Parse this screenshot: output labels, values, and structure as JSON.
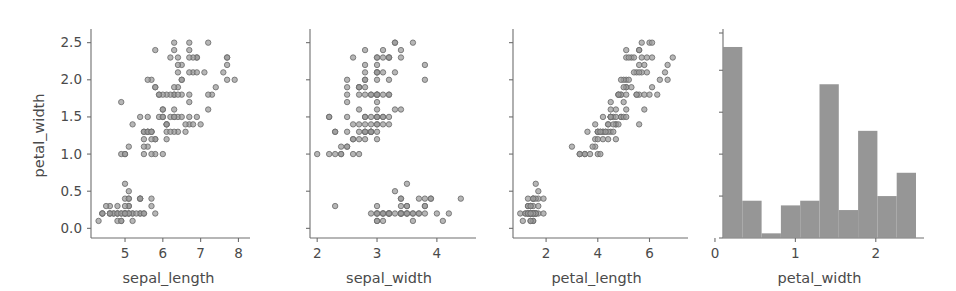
{
  "figure": {
    "type": "pairplot-row",
    "background": "#ffffff",
    "marker_color": "#9a9a9a",
    "marker_edge_color": "#6d6d6d",
    "bar_color": "#909090",
    "axis_color": "#6e6e6e",
    "text_color": "#4a4a4a",
    "shared_ylabel": "petal_width"
  },
  "chart_data": [
    {
      "type": "scatter",
      "title": "",
      "xlabel": "sepal_length",
      "ylabel": "petal_width",
      "xlim": [
        4.1,
        8.2
      ],
      "ylim": [
        -0.13,
        2.63
      ],
      "xticks": [
        5,
        6,
        7,
        8
      ],
      "xticklabels": [
        "5",
        "6",
        "7",
        "8"
      ],
      "yticks": [
        0.0,
        0.5,
        1.0,
        1.5,
        2.0,
        2.5
      ],
      "yticklabels": [
        "0.0",
        "0.5",
        "1.0",
        "1.5",
        "2.0",
        "2.5"
      ],
      "grid": false,
      "legend": "none",
      "x": [
        5.1,
        4.9,
        4.7,
        4.6,
        5.0,
        5.4,
        4.6,
        5.0,
        4.4,
        4.9,
        5.4,
        4.8,
        4.8,
        4.3,
        5.8,
        5.7,
        5.4,
        5.1,
        5.7,
        5.1,
        5.4,
        5.1,
        4.6,
        5.1,
        4.8,
        5.0,
        5.0,
        5.2,
        5.2,
        4.7,
        4.8,
        5.4,
        5.2,
        5.5,
        4.9,
        5.0,
        5.5,
        4.9,
        4.4,
        5.1,
        5.0,
        4.5,
        4.4,
        5.0,
        5.1,
        4.8,
        5.1,
        4.6,
        5.3,
        5.0,
        7.0,
        6.4,
        6.9,
        5.5,
        6.5,
        5.7,
        6.3,
        4.9,
        6.6,
        5.2,
        5.0,
        5.9,
        6.0,
        6.1,
        5.6,
        6.7,
        5.6,
        5.8,
        6.2,
        5.6,
        5.9,
        6.1,
        6.3,
        6.1,
        6.4,
        6.6,
        6.8,
        6.7,
        6.0,
        5.7,
        5.5,
        5.5,
        5.8,
        6.0,
        5.4,
        6.0,
        6.7,
        6.3,
        5.6,
        5.5,
        5.5,
        6.1,
        5.8,
        5.0,
        5.6,
        5.7,
        5.7,
        6.2,
        5.1,
        5.7,
        6.3,
        5.8,
        7.1,
        6.3,
        6.5,
        7.6,
        4.9,
        7.3,
        6.7,
        7.2,
        6.5,
        6.4,
        6.8,
        5.7,
        5.8,
        6.4,
        6.5,
        7.7,
        7.7,
        6.0,
        6.9,
        5.6,
        7.7,
        6.3,
        6.7,
        7.2,
        6.2,
        6.1,
        6.4,
        7.2,
        7.4,
        7.9,
        6.4,
        6.3,
        6.1,
        7.7,
        6.3,
        6.4,
        6.0,
        6.9,
        6.7,
        6.9,
        5.8,
        6.8,
        6.7,
        6.7,
        6.3,
        6.5,
        6.2,
        5.9
      ],
      "y": [
        0.2,
        0.2,
        0.2,
        0.2,
        0.2,
        0.4,
        0.3,
        0.2,
        0.2,
        0.1,
        0.2,
        0.2,
        0.1,
        0.1,
        0.2,
        0.4,
        0.4,
        0.3,
        0.3,
        0.3,
        0.2,
        0.4,
        0.2,
        0.5,
        0.2,
        0.2,
        0.4,
        0.2,
        0.2,
        0.2,
        0.2,
        0.4,
        0.1,
        0.2,
        0.2,
        0.2,
        0.2,
        0.1,
        0.2,
        0.2,
        0.3,
        0.3,
        0.2,
        0.6,
        0.4,
        0.3,
        0.2,
        0.2,
        0.2,
        0.2,
        1.4,
        1.5,
        1.5,
        1.3,
        1.5,
        1.3,
        1.6,
        1.0,
        1.3,
        1.4,
        1.0,
        1.5,
        1.0,
        1.4,
        1.3,
        1.4,
        1.5,
        1.0,
        1.5,
        1.1,
        1.8,
        1.3,
        1.5,
        1.2,
        1.3,
        1.4,
        1.4,
        1.7,
        1.5,
        1.0,
        1.1,
        1.0,
        1.2,
        1.6,
        1.5,
        1.6,
        1.5,
        1.3,
        1.3,
        1.3,
        1.2,
        1.4,
        1.2,
        1.0,
        1.3,
        1.2,
        1.3,
        1.3,
        1.1,
        1.3,
        2.5,
        1.9,
        2.1,
        1.8,
        2.2,
        2.1,
        1.7,
        1.8,
        1.8,
        2.5,
        2.0,
        1.9,
        2.1,
        2.0,
        2.4,
        2.3,
        1.8,
        2.2,
        2.3,
        1.5,
        2.3,
        2.0,
        2.0,
        1.8,
        2.1,
        1.8,
        1.8,
        1.8,
        2.1,
        1.6,
        1.9,
        2.0,
        2.2,
        1.5,
        1.4,
        2.3,
        2.4,
        1.8,
        1.8,
        2.1,
        2.4,
        2.3,
        1.9,
        2.3,
        2.5,
        2.3,
        1.9,
        2.0,
        2.3,
        1.8
      ]
    },
    {
      "type": "scatter",
      "title": "",
      "xlabel": "sepal_width",
      "ylabel": "petal_width",
      "xlim": [
        1.88,
        4.52
      ],
      "ylim": [
        -0.13,
        2.63
      ],
      "xticks": [
        2,
        3,
        4
      ],
      "xticklabels": [
        "2",
        "3",
        "4"
      ],
      "yticks": [
        0.0,
        0.5,
        1.0,
        1.5,
        2.0,
        2.5
      ],
      "yticklabels": [],
      "grid": false,
      "legend": "none",
      "x": [
        3.5,
        3.0,
        3.2,
        3.1,
        3.6,
        3.9,
        3.4,
        3.4,
        2.9,
        3.1,
        3.7,
        3.4,
        3.0,
        3.0,
        4.0,
        4.4,
        3.9,
        3.5,
        3.8,
        3.8,
        3.4,
        3.7,
        3.6,
        3.3,
        3.4,
        3.0,
        3.4,
        3.5,
        3.4,
        3.2,
        3.1,
        3.4,
        4.1,
        4.2,
        3.1,
        3.2,
        3.5,
        3.6,
        3.0,
        3.4,
        3.5,
        2.3,
        3.2,
        3.5,
        3.8,
        3.0,
        3.8,
        3.2,
        3.7,
        3.3,
        3.2,
        3.2,
        3.1,
        2.3,
        2.8,
        2.8,
        3.3,
        2.4,
        2.9,
        2.7,
        2.0,
        3.0,
        2.2,
        2.9,
        2.9,
        3.1,
        3.0,
        2.7,
        2.2,
        2.5,
        3.2,
        2.8,
        2.5,
        2.8,
        2.9,
        3.0,
        2.8,
        3.0,
        2.9,
        2.6,
        2.4,
        2.4,
        2.7,
        2.7,
        3.0,
        3.4,
        3.1,
        2.3,
        3.0,
        2.5,
        2.6,
        3.0,
        2.6,
        2.3,
        2.7,
        3.0,
        2.9,
        2.9,
        2.5,
        2.8,
        3.3,
        2.7,
        3.0,
        2.9,
        3.0,
        3.0,
        2.5,
        2.9,
        2.5,
        3.6,
        3.2,
        2.7,
        3.0,
        2.5,
        2.8,
        3.2,
        3.0,
        3.8,
        2.6,
        2.2,
        3.2,
        2.8,
        2.8,
        2.7,
        3.3,
        3.2,
        2.8,
        3.0,
        2.8,
        3.0,
        2.8,
        3.8,
        2.8,
        2.8,
        2.6,
        3.0,
        3.4,
        3.1,
        3.0,
        3.1,
        3.1,
        3.1,
        2.7,
        3.2,
        3.3,
        3.0,
        2.5,
        3.0,
        3.4,
        3.0
      ],
      "y": [
        0.2,
        0.2,
        0.2,
        0.2,
        0.2,
        0.4,
        0.3,
        0.2,
        0.2,
        0.1,
        0.2,
        0.2,
        0.1,
        0.1,
        0.2,
        0.4,
        0.4,
        0.3,
        0.3,
        0.3,
        0.2,
        0.4,
        0.2,
        0.5,
        0.2,
        0.2,
        0.4,
        0.2,
        0.2,
        0.2,
        0.2,
        0.4,
        0.1,
        0.2,
        0.2,
        0.2,
        0.2,
        0.1,
        0.2,
        0.2,
        0.3,
        0.3,
        0.2,
        0.6,
        0.4,
        0.3,
        0.2,
        0.2,
        0.2,
        0.2,
        1.4,
        1.5,
        1.5,
        1.3,
        1.5,
        1.3,
        1.6,
        1.0,
        1.3,
        1.4,
        1.0,
        1.5,
        1.0,
        1.4,
        1.3,
        1.4,
        1.5,
        1.0,
        1.5,
        1.1,
        1.8,
        1.3,
        1.5,
        1.2,
        1.3,
        1.4,
        1.4,
        1.7,
        1.5,
        1.0,
        1.1,
        1.0,
        1.2,
        1.6,
        1.5,
        1.6,
        1.5,
        1.3,
        1.3,
        1.3,
        1.2,
        1.4,
        1.2,
        1.0,
        1.3,
        1.2,
        1.3,
        1.3,
        1.1,
        1.3,
        2.5,
        1.9,
        2.1,
        1.8,
        2.2,
        2.1,
        1.7,
        1.8,
        1.8,
        2.5,
        2.0,
        1.9,
        2.1,
        2.0,
        2.4,
        2.3,
        1.8,
        2.2,
        2.3,
        1.5,
        2.3,
        2.0,
        2.0,
        1.8,
        2.1,
        1.8,
        1.8,
        1.8,
        2.1,
        1.6,
        1.9,
        2.0,
        2.2,
        1.5,
        1.4,
        2.3,
        2.4,
        1.8,
        1.8,
        2.1,
        2.4,
        2.3,
        1.9,
        2.3,
        2.5,
        2.3,
        1.9,
        2.0,
        2.3,
        1.8
      ]
    },
    {
      "type": "scatter",
      "title": "",
      "xlabel": "petal_length",
      "ylabel": "petal_width",
      "xlim": [
        0.72,
        7.18
      ],
      "ylim": [
        -0.13,
        2.63
      ],
      "xticks": [
        2,
        4,
        6
      ],
      "xticklabels": [
        "2",
        "4",
        "6"
      ],
      "yticks": [
        0.0,
        0.5,
        1.0,
        1.5,
        2.0,
        2.5
      ],
      "yticklabels": [],
      "grid": false,
      "legend": "none",
      "x": [
        1.4,
        1.4,
        1.3,
        1.5,
        1.4,
        1.7,
        1.4,
        1.5,
        1.4,
        1.5,
        1.5,
        1.6,
        1.4,
        1.1,
        1.2,
        1.5,
        1.3,
        1.4,
        1.7,
        1.5,
        1.7,
        1.5,
        1.0,
        1.7,
        1.9,
        1.6,
        1.6,
        1.5,
        1.4,
        1.6,
        1.6,
        1.5,
        1.5,
        1.4,
        1.5,
        1.2,
        1.3,
        1.4,
        1.3,
        1.5,
        1.3,
        1.3,
        1.3,
        1.6,
        1.9,
        1.4,
        1.6,
        1.4,
        1.5,
        1.4,
        4.7,
        4.5,
        4.9,
        4.0,
        4.6,
        4.5,
        4.7,
        3.3,
        4.6,
        3.9,
        3.5,
        4.2,
        4.0,
        4.7,
        3.6,
        4.4,
        4.5,
        4.1,
        4.5,
        3.9,
        4.8,
        4.0,
        4.9,
        4.7,
        4.3,
        4.4,
        4.8,
        5.0,
        4.5,
        3.5,
        3.8,
        3.7,
        3.9,
        5.1,
        4.5,
        4.5,
        4.7,
        4.4,
        4.1,
        4.0,
        4.4,
        4.6,
        4.0,
        3.3,
        4.2,
        4.2,
        4.2,
        4.3,
        3.0,
        4.1,
        6.0,
        5.1,
        5.9,
        5.6,
        5.8,
        6.6,
        4.5,
        6.3,
        5.8,
        6.1,
        5.1,
        5.3,
        5.5,
        5.0,
        5.1,
        5.3,
        5.5,
        6.7,
        6.9,
        5.0,
        5.7,
        4.9,
        6.7,
        4.9,
        5.7,
        6.0,
        4.8,
        4.9,
        5.6,
        5.8,
        6.1,
        6.4,
        5.6,
        5.1,
        5.6,
        6.1,
        5.6,
        5.5,
        4.8,
        5.4,
        5.6,
        5.1,
        5.1,
        5.9,
        5.7,
        5.2,
        5.0,
        5.2,
        5.4,
        5.1
      ],
      "y": [
        0.2,
        0.2,
        0.2,
        0.2,
        0.2,
        0.4,
        0.3,
        0.2,
        0.2,
        0.1,
        0.2,
        0.2,
        0.1,
        0.1,
        0.2,
        0.4,
        0.4,
        0.3,
        0.3,
        0.3,
        0.2,
        0.4,
        0.2,
        0.5,
        0.2,
        0.2,
        0.4,
        0.2,
        0.2,
        0.2,
        0.2,
        0.4,
        0.1,
        0.2,
        0.2,
        0.2,
        0.2,
        0.1,
        0.2,
        0.2,
        0.3,
        0.3,
        0.2,
        0.6,
        0.4,
        0.3,
        0.2,
        0.2,
        0.2,
        0.2,
        1.4,
        1.5,
        1.5,
        1.3,
        1.5,
        1.3,
        1.6,
        1.0,
        1.3,
        1.4,
        1.0,
        1.5,
        1.0,
        1.4,
        1.3,
        1.4,
        1.5,
        1.0,
        1.5,
        1.1,
        1.8,
        1.3,
        1.5,
        1.2,
        1.3,
        1.4,
        1.4,
        1.7,
        1.5,
        1.0,
        1.1,
        1.0,
        1.2,
        1.6,
        1.5,
        1.6,
        1.5,
        1.3,
        1.3,
        1.3,
        1.2,
        1.4,
        1.2,
        1.0,
        1.3,
        1.2,
        1.3,
        1.3,
        1.1,
        1.3,
        2.5,
        1.9,
        2.1,
        1.8,
        2.2,
        2.1,
        1.7,
        1.8,
        1.8,
        2.5,
        2.0,
        1.9,
        2.1,
        2.0,
        2.4,
        2.3,
        1.8,
        2.2,
        2.3,
        1.5,
        2.3,
        2.0,
        2.0,
        1.8,
        2.1,
        1.8,
        1.8,
        1.8,
        2.1,
        1.6,
        1.9,
        2.0,
        2.2,
        1.5,
        1.4,
        2.3,
        2.4,
        1.8,
        1.8,
        2.1,
        2.4,
        2.3,
        1.9,
        2.3,
        2.5,
        2.3,
        1.9,
        2.0,
        2.3,
        1.8
      ]
    },
    {
      "type": "bar",
      "subtype": "histogram",
      "title": "",
      "xlabel": "petal_width",
      "ylabel": "",
      "xlim": [
        0.1,
        2.5
      ],
      "ylim": [
        0,
        44
      ],
      "xticks": [
        0,
        1,
        2
      ],
      "xticklabels": [
        "0",
        "1",
        "2"
      ],
      "yticks": [
        0,
        9,
        18,
        27,
        36,
        44
      ],
      "yticklabels": [],
      "grid": false,
      "legend": "none",
      "bin_edges": [
        0.1,
        0.34,
        0.58,
        0.82,
        1.06,
        1.3,
        1.54,
        1.78,
        2.02,
        2.26,
        2.5
      ],
      "categories": [
        "0.10-0.34",
        "0.34-0.58",
        "0.58-0.82",
        "0.82-1.06",
        "1.06-1.30",
        "1.30-1.54",
        "1.54-1.78",
        "1.78-2.02",
        "2.02-2.26",
        "2.26-2.50"
      ],
      "values": [
        41,
        8,
        1,
        7,
        8,
        33,
        6,
        23,
        9,
        14
      ]
    }
  ]
}
